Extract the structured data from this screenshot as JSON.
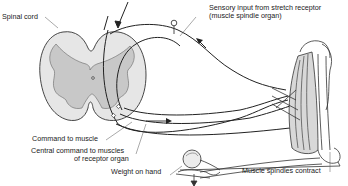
{
  "diagram": {
    "type": "anatomical stretch reflex diagram",
    "labels": {
      "spinal_cord": "Spinal cord",
      "sensory_input_line1": "Sensory input from stretch receptor",
      "sensory_input_line2": "(muscle spindle organ)",
      "command_to_muscle": "Command to muscle",
      "central_command_line1": "Central command to muscles",
      "central_command_line2": "of receptor organ",
      "weight_on_hand": "Weight on hand",
      "muscle_spindles_contract": "Muscle spindles contract"
    },
    "colors": {
      "line": "#1a1a1a",
      "gray_matter": "#c8c8c8",
      "white_matter": "#e6e6e6"
    }
  }
}
